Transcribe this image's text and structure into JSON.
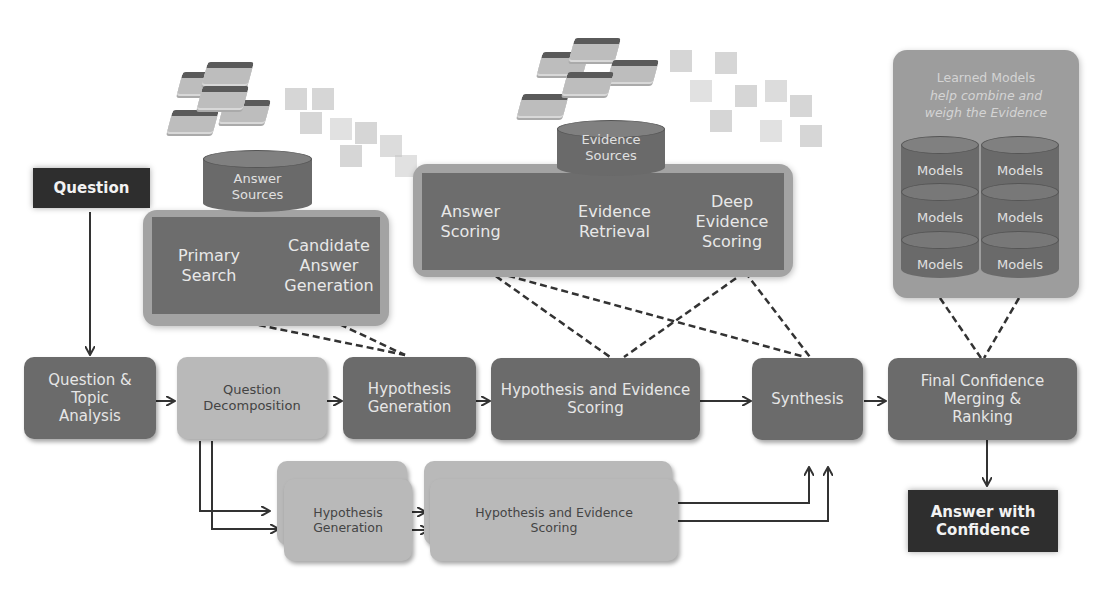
{
  "diagram": {
    "question": "Question",
    "answer_with_confidence": [
      "Answer with",
      "Confidence"
    ],
    "answer_sources": {
      "db_label": [
        "Answer",
        "Sources"
      ],
      "steps": [
        {
          "label": [
            "Primary",
            "Search"
          ]
        },
        {
          "label": [
            "Candidate",
            "Answer",
            "Generation"
          ]
        }
      ]
    },
    "evidence_sources": {
      "db_label": [
        "Evidence",
        "Sources"
      ],
      "steps": [
        {
          "label": [
            "Answer",
            "Scoring"
          ]
        },
        {
          "label": [
            "Evidence",
            "Retrieval"
          ]
        },
        {
          "label": [
            "Deep",
            "Evidence",
            "Scoring"
          ]
        }
      ]
    },
    "learned_models": {
      "caption": [
        "Learned Models",
        "help combine and",
        "weigh the Evidence"
      ],
      "model_label": "Models",
      "count": 6
    },
    "pipeline": [
      {
        "id": "qta",
        "label": [
          "Question &",
          "Topic",
          "Analysis"
        ]
      },
      {
        "id": "qd",
        "label": [
          "Question",
          "Decomposition"
        ]
      },
      {
        "id": "hg",
        "label": [
          "Hypothesis",
          "Generation"
        ]
      },
      {
        "id": "hes",
        "label": [
          "Hypothesis and Evidence",
          "Scoring"
        ]
      },
      {
        "id": "syn",
        "label": [
          "Synthesis"
        ]
      },
      {
        "id": "fcmr",
        "label": [
          "Final Confidence",
          "Merging &",
          "Ranking"
        ]
      }
    ],
    "parallel": [
      {
        "id": "hg2",
        "label": [
          "Hypothesis",
          "Generation"
        ]
      },
      {
        "id": "hes2",
        "label": [
          "Hypothesis and Evidence",
          "Scoring"
        ]
      }
    ],
    "colors": {
      "dark_box": "#6b6b6b",
      "light_box": "#b9b9b9",
      "black_box": "#2e2e2e",
      "container": "#a3a3a3",
      "connector": "#333333"
    }
  }
}
